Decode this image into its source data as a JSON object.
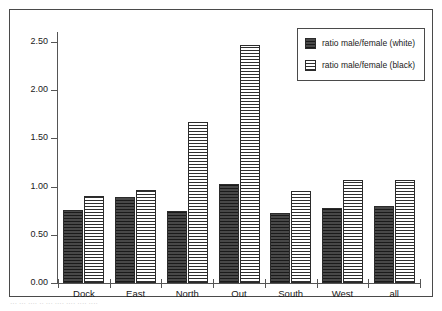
{
  "chart_data": {
    "type": "bar",
    "title": "",
    "subtitle": "",
    "xlabel": "",
    "ylabel": "",
    "categories": [
      "Dock",
      "East",
      "North",
      "Out",
      "South",
      "West",
      "all"
    ],
    "series": [
      {
        "name": "ratio male/female (white)",
        "fill": "solid-dark",
        "values": [
          0.76,
          0.89,
          0.75,
          1.03,
          0.73,
          0.78,
          0.8
        ]
      },
      {
        "name": "ratio male/female (black)",
        "fill": "horizontal-hatch",
        "values": [
          0.9,
          0.96,
          1.67,
          2.47,
          0.95,
          1.07,
          1.07
        ]
      }
    ],
    "ylim": [
      0.0,
      2.5
    ],
    "ytick_values": [
      0.0,
      0.5,
      1.0,
      1.5,
      2.0,
      2.5
    ],
    "ytick_labels": [
      "0.00",
      "0.50",
      "1.00",
      "1.50",
      "2.00",
      "2.50"
    ],
    "grid": false,
    "legend_position": "top-right",
    "legend_entries": [
      "ratio male/female (white)",
      "ratio male/female (black)"
    ]
  },
  "figure": {
    "frame_border_color": "#4a4a4a",
    "background_color": "#ffffff",
    "axis_color": "#555555",
    "series_0_color": "#3a3a3a",
    "series_1_color": "#2f2f2f",
    "caption_fragment": "···  ··· ···· ·· ···  ···· ···· ···· ····"
  }
}
